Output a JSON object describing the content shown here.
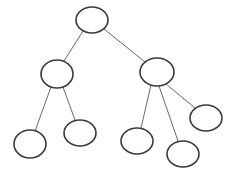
{
  "diagram": {
    "type": "tree",
    "background": "#ffffff",
    "node_stroke": "#3a3a3a",
    "edge_stroke": "#6a6a6a",
    "nodes": [
      {
        "id": "root",
        "cx": 92,
        "cy": 20,
        "rx": 16,
        "ry": 13,
        "label": ""
      },
      {
        "id": "left",
        "cx": 57,
        "cy": 74,
        "rx": 16,
        "ry": 14,
        "label": ""
      },
      {
        "id": "right",
        "cx": 157,
        "cy": 72,
        "rx": 17,
        "ry": 14,
        "label": ""
      },
      {
        "id": "leaf-1",
        "cx": 30,
        "cy": 144,
        "rx": 16,
        "ry": 14,
        "label": ""
      },
      {
        "id": "leaf-2",
        "cx": 80,
        "cy": 133,
        "rx": 16,
        "ry": 13,
        "label": ""
      },
      {
        "id": "leaf-3",
        "cx": 137,
        "cy": 141,
        "rx": 16,
        "ry": 13,
        "label": ""
      },
      {
        "id": "leaf-4",
        "cx": 183,
        "cy": 154,
        "rx": 16,
        "ry": 13,
        "label": ""
      },
      {
        "id": "leaf-5",
        "cx": 206,
        "cy": 118,
        "rx": 16,
        "ry": 13,
        "label": ""
      }
    ],
    "edges": [
      {
        "from": "root",
        "to": "left",
        "x1": 83,
        "y1": 31,
        "x2": 64,
        "y2": 61
      },
      {
        "from": "root",
        "to": "right",
        "x1": 104,
        "y1": 29,
        "x2": 145,
        "y2": 62
      },
      {
        "from": "left",
        "to": "leaf-1",
        "x1": 51,
        "y1": 87,
        "x2": 35,
        "y2": 131
      },
      {
        "from": "left",
        "to": "leaf-2",
        "x1": 63,
        "y1": 87,
        "x2": 75,
        "y2": 120
      },
      {
        "from": "right",
        "to": "leaf-3",
        "x1": 151,
        "y1": 85,
        "x2": 141,
        "y2": 128
      },
      {
        "from": "right",
        "to": "leaf-4",
        "x1": 159,
        "y1": 86,
        "x2": 178,
        "y2": 141
      },
      {
        "from": "right",
        "to": "leaf-5",
        "x1": 166,
        "y1": 84,
        "x2": 195,
        "y2": 108
      }
    ]
  }
}
